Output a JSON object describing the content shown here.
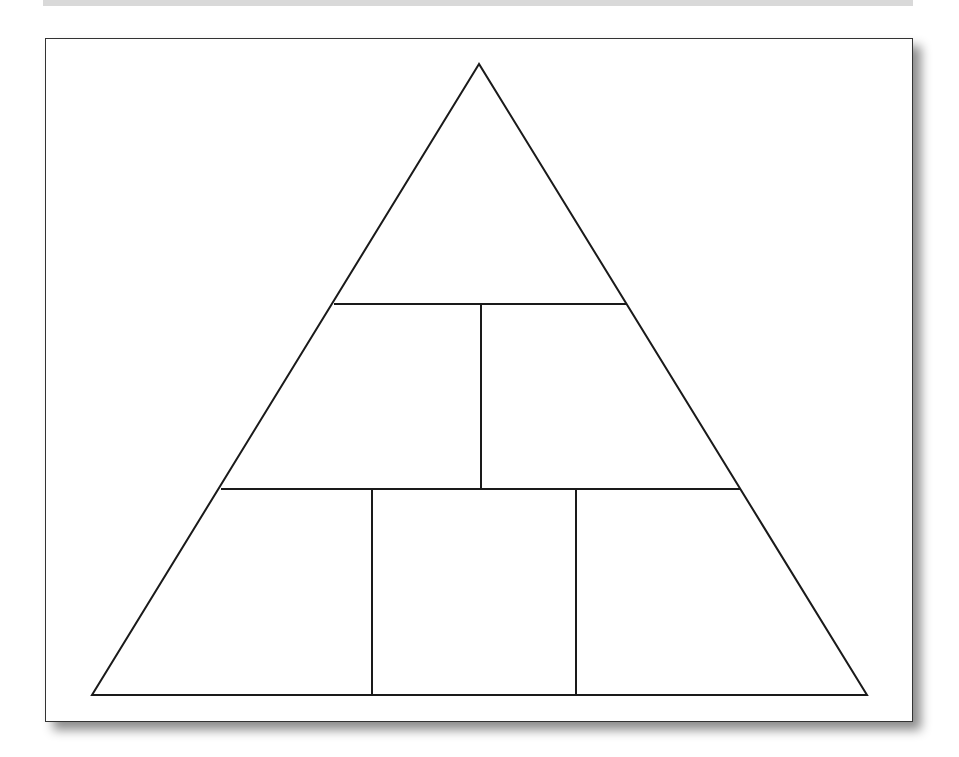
{
  "diagram": {
    "type": "pyramid",
    "title": "",
    "levels": [
      {
        "level": 1,
        "cells": [
          {
            "label": ""
          }
        ]
      },
      {
        "level": 2,
        "cells": [
          {
            "label": ""
          },
          {
            "label": ""
          }
        ]
      },
      {
        "level": 3,
        "cells": [
          {
            "label": ""
          },
          {
            "label": ""
          },
          {
            "label": ""
          }
        ]
      }
    ],
    "geometry": {
      "apex": [
        479,
        64
      ],
      "base_left": [
        92,
        695
      ],
      "base_right": [
        867,
        695
      ],
      "divider_1_y": 304,
      "divider_1_x_range": [
        334,
        627
      ],
      "divider_1_vertical_x": 481,
      "divider_2_y": 489,
      "divider_2_x_range": [
        221,
        741
      ],
      "divider_2_vertical_xs": [
        372,
        576
      ]
    }
  },
  "colors": {
    "top_band": "#d9d9d9",
    "stroke": "#1a1a1a",
    "frame_border": "#333333",
    "background": "#ffffff"
  }
}
